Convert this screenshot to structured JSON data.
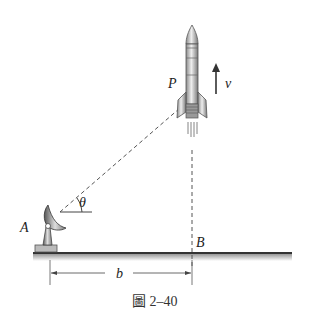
{
  "figure": {
    "caption": "圖 2–40",
    "labels": {
      "point_p": "P",
      "velocity": "v",
      "angle": "θ",
      "point_a": "A",
      "point_b": "B",
      "distance": "b"
    }
  },
  "colors": {
    "line": "#333333",
    "ground": "#444444",
    "rocket_body": "#c8c8c8",
    "rocket_outline": "#555555",
    "dish": "#9a9a9a"
  }
}
